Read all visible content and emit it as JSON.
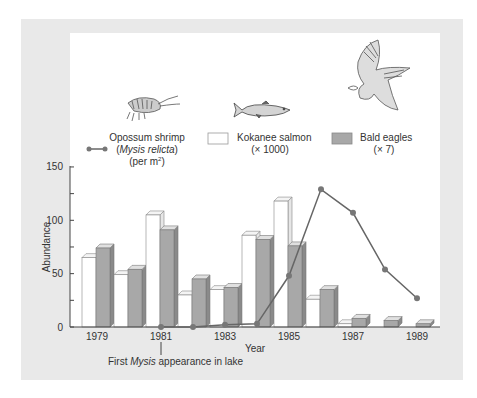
{
  "chart_data": {
    "type": "bar",
    "title": "",
    "xlabel": "Year",
    "ylabel": "Abundance",
    "ylim": [
      0,
      150
    ],
    "yticks": [
      0,
      50,
      100,
      150
    ],
    "yminor_ticks": [
      25,
      75,
      125
    ],
    "grid": false,
    "categories": [
      "1979",
      "1980",
      "1981",
      "1982",
      "1983",
      "1984",
      "1985",
      "1986",
      "1987",
      "1988",
      "1989"
    ],
    "xtick_labels": [
      "1979",
      "1981",
      "1983",
      "1985",
      "1987",
      "1989"
    ],
    "series": [
      {
        "name": "Kokanee salmon",
        "unit": "(× 1000)",
        "type": "bar",
        "color": "#ffffff",
        "values": [
          65,
          49,
          105,
          30,
          35,
          86,
          118,
          26,
          3,
          0,
          0
        ]
      },
      {
        "name": "Bald eagles",
        "unit": "(× 7)",
        "type": "bar",
        "color": "#a8a8a8",
        "values": [
          74,
          54,
          91,
          45,
          37,
          82,
          76,
          35,
          8,
          6,
          3
        ]
      },
      {
        "name": "Opossum shrimp (Mysis relicta)",
        "unit": "(per m²)",
        "type": "line",
        "color": "#666666",
        "x": [
          "1981",
          "1982",
          "1983",
          "1984",
          "1985",
          "1986",
          "1987",
          "1988",
          "1989"
        ],
        "values": [
          0,
          0,
          2,
          3,
          48,
          129,
          107,
          54,
          27
        ]
      }
    ],
    "legend": {
      "position": "top",
      "entries": [
        {
          "label_line1": "Opossum shrimp",
          "label_line2": "(Mysis relicta)",
          "label_line3": "(per m²)",
          "marker": "line-dot"
        },
        {
          "label_line1": "Kokanee salmon",
          "label_line2": "(× 1000)",
          "marker": "white-box"
        },
        {
          "label_line1": "Bald eagles",
          "label_line2": "(× 7)",
          "marker": "gray-box"
        }
      ]
    },
    "annotations": [
      {
        "text_prefix": "First ",
        "text_italic": "Mysis",
        "text_suffix": " appearance in lake",
        "x": "1981"
      }
    ]
  },
  "legend": {
    "shrimp": {
      "line1": "Opossum shrimp",
      "line2_open": "(",
      "line2_italic": "Mysis relicta",
      "line2_close": ")",
      "line3": "(per m",
      "line3_sup": "2",
      "line3_close": ")",
      "icon": "shrimp-icon"
    },
    "salmon": {
      "line1": "Kokanee salmon",
      "line2": "(× 1000)",
      "icon": "fish-icon"
    },
    "eagle": {
      "line1": "Bald eagles",
      "line2": "(× 7)",
      "icon": "eagle-icon"
    }
  },
  "axes": {
    "ylabel": "Abundance",
    "xlabel": "Year",
    "yticks": [
      "0",
      "50",
      "100",
      "150"
    ],
    "xticks": [
      "1979",
      "1981",
      "1983",
      "1985",
      "1987",
      "1989"
    ]
  },
  "annotation": {
    "prefix": "First ",
    "italic": "Mysis",
    "suffix": " appearance in lake"
  },
  "colors": {
    "panel": "#e9e9e9",
    "bar_gray": "#a8a8a8",
    "bar_gray_side": "#8a8a8a",
    "line": "#666666",
    "dot": "#777777"
  }
}
